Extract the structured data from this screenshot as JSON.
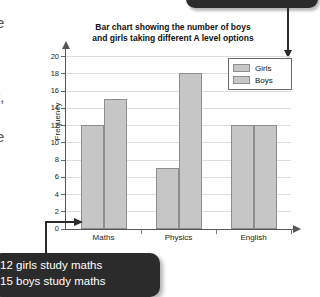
{
  "chart_data": {
    "type": "bar",
    "title": "Bar chart showing the number of boys and girls taking different A level options",
    "title_line_1": "Bar chart showing the number of boys",
    "title_line_2": "and girls taking different A level options",
    "xlabel": "",
    "ylabel": "Frequency",
    "categories": [
      "Maths",
      "Physics",
      "English"
    ],
    "series": [
      {
        "name": "Girls",
        "values": [
          12,
          7,
          12
        ]
      },
      {
        "name": "Boys",
        "values": [
          15,
          18,
          12
        ]
      }
    ],
    "ylim": [
      0,
      20
    ],
    "ytick_step": 2,
    "yticks": [
      0,
      2,
      4,
      6,
      8,
      10,
      12,
      14,
      16,
      18,
      20
    ],
    "grid": true,
    "legend_position": "top-right",
    "bar_fill_color": "#c6c6c6",
    "bar_border_color": "#8d8d8d",
    "axis_color": "#555555",
    "gridline_color": "#dddddd"
  },
  "annotations": {
    "top_callout": {
      "text": ""
    },
    "bottom_callout": {
      "line_1": "12 girls study maths",
      "line_2": "15 boys study maths",
      "background_color": "#2b2b2b",
      "text_color": "#ffffff"
    }
  },
  "edge_fragments": {
    "frag_1": "e",
    "frag_2": "t,",
    "frag_3": "e"
  }
}
